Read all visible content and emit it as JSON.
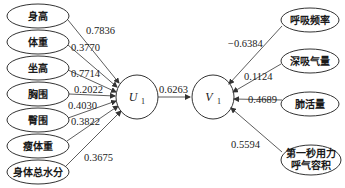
{
  "diagram": {
    "left_nodes": [
      {
        "label": "身高",
        "coef": "0.7836"
      },
      {
        "label": "体重",
        "coef": "0.3770"
      },
      {
        "label": "坐高",
        "coef": "0.7714"
      },
      {
        "label": "胸围",
        "coef": "0.2022"
      },
      {
        "label": "臀围",
        "coef": "0.4030"
      },
      {
        "label": "瘦体重",
        "coef": "0.3822"
      },
      {
        "label": "身体总水分",
        "coef": "0.3675"
      }
    ],
    "latent_u": {
      "symbol": "U",
      "subscript": "1"
    },
    "latent_v": {
      "symbol": "V",
      "subscript": "1"
    },
    "canonical_correlation": "0.6263",
    "right_nodes": [
      {
        "label": "呼吸频率",
        "coef": "−0.6384"
      },
      {
        "label": "深吸气量",
        "coef": "0.1124"
      },
      {
        "label": "肺活量",
        "coef": "0.4689"
      },
      {
        "label": "第一秒用力",
        "label_line2": "呼气容积",
        "coef": "0.5594"
      }
    ],
    "colors": {
      "stroke": "#333333",
      "text": "#1a1a1a",
      "background": "#ffffff"
    }
  }
}
